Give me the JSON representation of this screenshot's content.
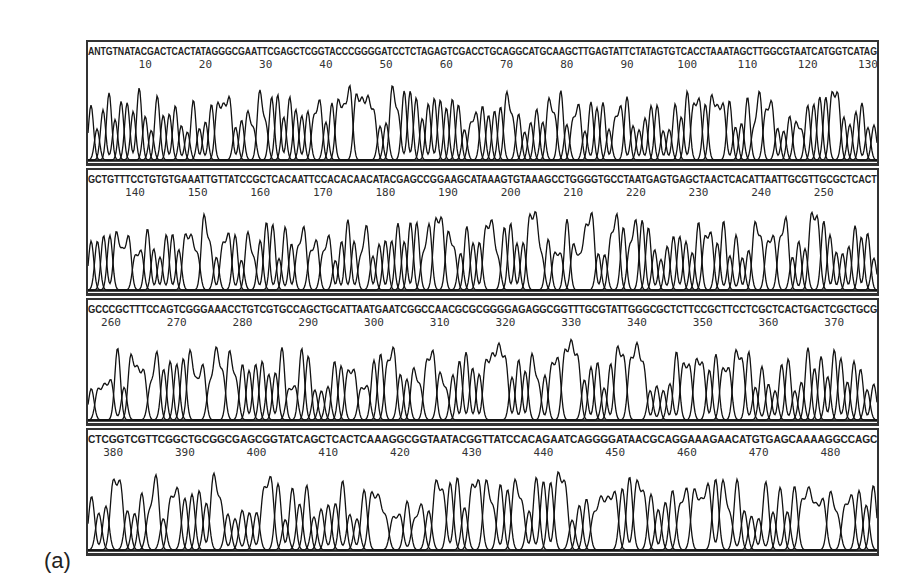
{
  "figure": {
    "panel_label": "(a)"
  },
  "chart_data": {
    "type": "line",
    "xlabel": "Base position",
    "ylabel": "Fluorescence intensity",
    "grid": false,
    "legend": "none",
    "panels": [
      {
        "sequence": "ANTGTNATACGACTCACTATAGGGCGAATTCGAGCTCGGTACCCGGGGATCCTCTAGAGTCGACCTGCAGGCATGCAAGCTTGAGTATTCTATAGTGTCACCTAAATAGCTTGGCGTAATCATGGTCATAG",
        "ticks": [
          10,
          20,
          30,
          40,
          50,
          60,
          70,
          80,
          90,
          100,
          110,
          120,
          130
        ],
        "x_range": [
          1,
          132
        ]
      },
      {
        "sequence": "GCTGTTTCCTGTGTGAAATTGTTATCCGCTCACAATTCCACACAACATACGAGCCGGAAGCATAAAGTGTAAAGCCTGGGGTGCCTAATGAGTGAGCTAACTCACATTAATTGCGTTGCGCTCACT",
        "ticks": [
          140,
          150,
          160,
          170,
          180,
          190,
          200,
          210,
          220,
          230,
          240,
          250
        ],
        "x_range": [
          133,
          256
        ]
      },
      {
        "sequence": "GCCCGCTTTCCAGTCGGGAAACCTGTCGTGCCAGCTGCATTAATGAATCGGCCAACGCGCGGGGAGAGGCGGTTTGCGTATTGGGCGCTCTTCCGCTTCCTCGCTCACTGACTCGCTGCG",
        "ticks": [
          260,
          270,
          280,
          290,
          300,
          310,
          320,
          330,
          340,
          350,
          360,
          370
        ],
        "x_range": [
          257,
          376
        ]
      },
      {
        "sequence": "CTCGGTCGTTCGGCTGCGGCGAGCGGTATCAGCTCACTCAAAGGCGGTAATACGGTTATCCACAGAATCAGGGGATAACGCAGGAAAGAACATGTGAGCAAAAGGCCAGC",
        "ticks": [
          380,
          390,
          400,
          410,
          420,
          430,
          440,
          450,
          460,
          470,
          480
        ],
        "x_range": [
          377,
          487
        ]
      }
    ]
  }
}
